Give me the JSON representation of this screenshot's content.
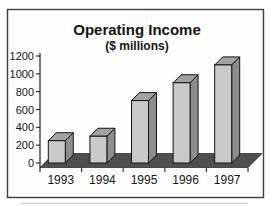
{
  "chart_data": {
    "type": "bar",
    "style": "3d-bar",
    "title": "Operating Income",
    "subtitle": "($ millions)",
    "categories": [
      "1993",
      "1994",
      "1995",
      "1996",
      "1997"
    ],
    "values": [
      250,
      300,
      700,
      900,
      1100
    ],
    "xlabel": "",
    "ylabel": "",
    "ylim": [
      0,
      1200
    ],
    "ytick_step": 200,
    "ytick_labels": [
      "0",
      "200",
      "400",
      "600",
      "800",
      "1000",
      "1200"
    ],
    "grid": false,
    "legend": false,
    "colors": {
      "background": "#fdfdfc",
      "frame_border": "#3f3f3f",
      "bar_front": "#c9c9c9",
      "bar_side": "#8d8d8d",
      "bar_top": "#a2a2a2",
      "bar_outline": "#141414",
      "floor": "#4f4f4f",
      "axis": "#222222",
      "text": "#141414"
    }
  }
}
